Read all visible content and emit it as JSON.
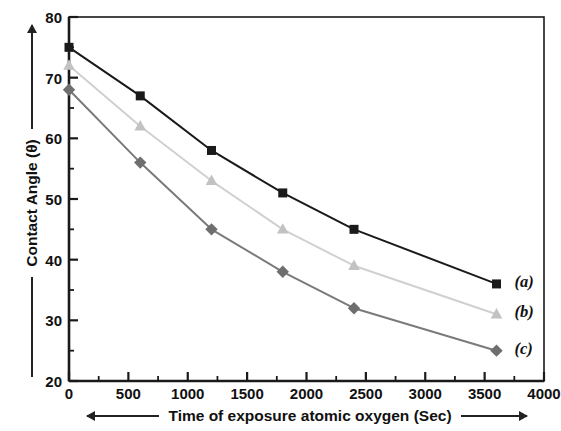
{
  "chart_data": {
    "type": "line",
    "title": "",
    "subtitle": "",
    "xlabel": "Time of exposure atomic oxygen (Sec)",
    "ylabel": "Contact Angle (θ)",
    "xlim": [
      0,
      4000
    ],
    "ylim": [
      20,
      80
    ],
    "x_major_ticks": [
      0,
      500,
      1000,
      1500,
      2000,
      2500,
      3000,
      3500,
      4000
    ],
    "x_tick_labels": [
      "0",
      "500",
      "1000",
      "1500",
      "2000",
      "2500",
      "3000",
      "3500",
      "4000"
    ],
    "x_minor_interval": 250,
    "y_major_ticks": [
      20,
      30,
      40,
      50,
      60,
      70,
      80
    ],
    "y_tick_labels": [
      "20",
      "30",
      "40",
      "50",
      "60",
      "70",
      "80"
    ],
    "y_minor_interval": 5,
    "grid": false,
    "legend_position": "inside-right-labels",
    "x": [
      0,
      600,
      1200,
      1800,
      2400,
      3600
    ],
    "series": [
      {
        "name": "(a)",
        "marker": "square",
        "color": "#1a1a1a",
        "line_color": "#1a1a1a",
        "values": [
          75,
          67,
          58,
          51,
          45,
          36
        ]
      },
      {
        "name": "(b)",
        "marker": "triangle",
        "color": "#c2c2c2",
        "line_color": "#d0d0d0",
        "values": [
          72,
          62,
          53,
          45,
          39,
          31
        ]
      },
      {
        "name": "(c)",
        "marker": "diamond",
        "color": "#6e6e6e",
        "line_color": "#7a7a7a",
        "values": [
          68,
          56,
          45,
          38,
          32,
          25
        ]
      }
    ],
    "annotations": [
      {
        "text": "(a)",
        "series": "(a)"
      },
      {
        "text": "(b)",
        "series": "(b)"
      },
      {
        "text": "(c)",
        "series": "(c)"
      }
    ],
    "axis_arrow_x": "right-and-left",
    "axis_arrow_y": "up"
  },
  "axes": {
    "frame_color": "#1a1a1a"
  }
}
